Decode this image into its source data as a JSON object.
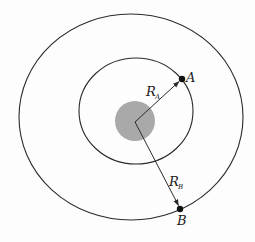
{
  "diagram": {
    "type": "concentric-orbits",
    "colors": {
      "background": "#fdfdfd",
      "stroke": "#2a2a2a",
      "central_body": "#a9a9a9"
    },
    "central_body": {
      "cx": 135,
      "cy": 121,
      "r": 20
    },
    "orbits": [
      {
        "name": "inner-orbit",
        "cx": 136,
        "cy": 111,
        "rx": 57,
        "ry": 53
      },
      {
        "name": "outer-orbit",
        "cx": 131,
        "cy": 117,
        "rx": 112,
        "ry": 103
      }
    ],
    "center": {
      "x": 135,
      "y": 122
    },
    "points": [
      {
        "id": "A",
        "label": "A",
        "x": 182,
        "y": 79
      },
      {
        "id": "B",
        "label": "B",
        "x": 180,
        "y": 209
      }
    ],
    "radius_vectors": [
      {
        "id": "RA",
        "label_main": "R",
        "label_sub": "A",
        "to": "A"
      },
      {
        "id": "RB",
        "label_main": "R",
        "label_sub": "B",
        "to": "B"
      }
    ]
  }
}
